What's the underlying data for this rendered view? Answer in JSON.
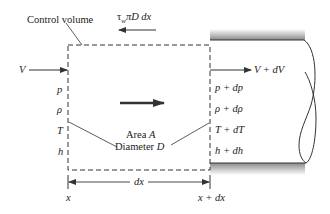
{
  "diagram": {
    "control_volume_label": "Control volume",
    "shear_force_label": "τ_w πD dx",
    "shear_force_parts": {
      "tau": "τ",
      "sub": "w",
      "rest": "πD dx"
    },
    "inlet": {
      "velocity": "V",
      "properties": [
        "p",
        "ρ",
        "T",
        "h"
      ]
    },
    "outlet": {
      "velocity": "V + dV",
      "properties": [
        "p + dp",
        "ρ + dρ",
        "T + dT",
        "h + dh"
      ]
    },
    "center": {
      "area_label": "Area A",
      "area_word": "Area",
      "area_symbol": "A",
      "diameter_word": "Diameter",
      "diameter_symbol": "D"
    },
    "dimension": {
      "length_label": "dx",
      "start_label": "x",
      "end_label": "x + dx"
    },
    "colors": {
      "line": "#333333",
      "pipe_shade": "#8a8a8a",
      "background": "#ffffff"
    }
  }
}
